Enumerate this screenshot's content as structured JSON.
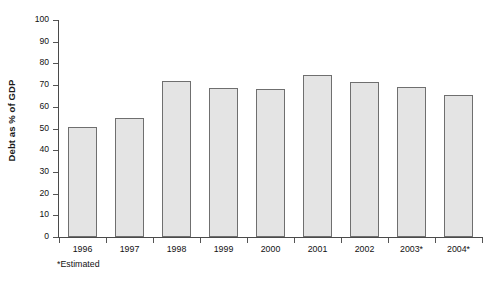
{
  "chart_data": {
    "type": "bar",
    "title": "",
    "xlabel": "",
    "ylabel": "Debt as % of GDP",
    "categories": [
      "1996",
      "1997",
      "1998",
      "1999",
      "2000",
      "2001",
      "2002",
      "2003*",
      "2004*"
    ],
    "values": [
      50.5,
      55,
      72,
      68.5,
      68,
      74.5,
      71.5,
      69,
      65.5
    ],
    "ylim": [
      0,
      100
    ],
    "ytick_labels": [
      "100",
      "90",
      "80",
      "70",
      "60",
      "50",
      "40",
      "30",
      "20",
      "10",
      "0"
    ],
    "ytick_values": [
      100,
      90,
      80,
      70,
      60,
      50,
      40,
      30,
      20,
      10,
      0
    ],
    "grid": false,
    "legend": "none",
    "footnote": "*Estimated",
    "bar_fill_color": "#e4e4e4",
    "bar_border_color": "#6f6f6f",
    "axis_color": "#4a4a4a",
    "text_color": "#111111",
    "background_color": "#ffffff"
  }
}
